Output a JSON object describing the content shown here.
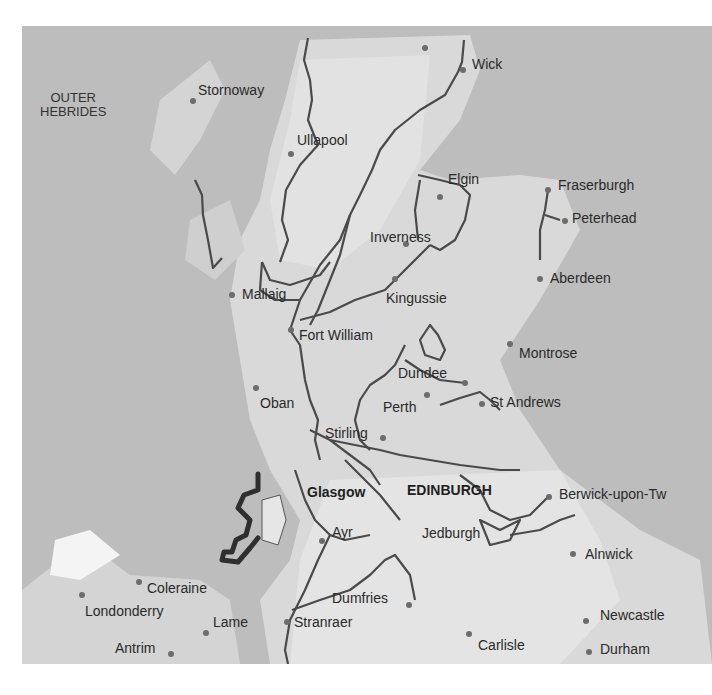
{
  "map": {
    "region_labels": [
      {
        "text": "OUTER\nHEBRIDES",
        "line1": "OUTER",
        "line2": "HEBRIDES",
        "x": 40,
        "y": 91
      }
    ],
    "towns": [
      {
        "name": "Thurso",
        "x": 368,
        "y": 3,
        "dot": [
          425,
          48
        ]
      },
      {
        "name": "Wick",
        "x": 472,
        "y": 57,
        "dot": [
          463,
          70
        ]
      },
      {
        "name": "Stornoway",
        "x": 198,
        "y": 83,
        "dot": [
          193,
          101
        ]
      },
      {
        "name": "Ullapool",
        "x": 297,
        "y": 133,
        "dot": [
          291,
          154
        ]
      },
      {
        "name": "Elgin",
        "x": 448,
        "y": 172,
        "dot": [
          440,
          197
        ]
      },
      {
        "name": "Fraserburgh",
        "x": 558,
        "y": 178,
        "dot": [
          548,
          190
        ]
      },
      {
        "name": "Peterhead",
        "x": 572,
        "y": 211,
        "dot": [
          565,
          221
        ]
      },
      {
        "name": "Inverness",
        "x": 370,
        "y": 230,
        "dot": [
          406,
          244
        ]
      },
      {
        "name": "Aberdeen",
        "x": 550,
        "y": 271,
        "dot": [
          540,
          279
        ]
      },
      {
        "name": "Mallaig",
        "x": 242,
        "y": 287,
        "dot": [
          232,
          295
        ]
      },
      {
        "name": "Kingussie",
        "x": 386,
        "y": 291,
        "dot": [
          395,
          279
        ]
      },
      {
        "name": "Fort William",
        "x": 299,
        "y": 328,
        "dot": [
          291,
          330
        ]
      },
      {
        "name": "Montrose",
        "x": 519,
        "y": 346,
        "dot": [
          510,
          344
        ]
      },
      {
        "name": "Dundee",
        "x": 398,
        "y": 366,
        "dot": [
          465,
          383
        ]
      },
      {
        "name": "Oban",
        "x": 260,
        "y": 396,
        "dot": [
          256,
          388
        ]
      },
      {
        "name": "Perth",
        "x": 383,
        "y": 400,
        "dot": [
          427,
          395
        ]
      },
      {
        "name": "St Andrews",
        "x": 490,
        "y": 395,
        "dot": [
          482,
          404
        ]
      },
      {
        "name": "Stirling",
        "x": 325,
        "y": 426,
        "dot": [
          383,
          438
        ]
      },
      {
        "name": "Glasgow",
        "x": 307,
        "y": 485,
        "bold": true,
        "dot": null
      },
      {
        "name": "EDINBURGH",
        "x": 407,
        "y": 483,
        "bold": true,
        "dot": null
      },
      {
        "name": "Berwick-upon-Tw",
        "x": 559,
        "y": 487,
        "dot": [
          549,
          497
        ]
      },
      {
        "name": "Ayr",
        "x": 332,
        "y": 525,
        "dot": [
          322,
          541
        ]
      },
      {
        "name": "Jedburgh",
        "x": 422,
        "y": 526,
        "dot": null
      },
      {
        "name": "Alnwick",
        "x": 585,
        "y": 547,
        "dot": [
          573,
          554
        ]
      },
      {
        "name": "Coleraine",
        "x": 147,
        "y": 581,
        "dot": [
          139,
          582
        ]
      },
      {
        "name": "Londonderry",
        "x": 85,
        "y": 604,
        "dot": [
          82,
          595
        ]
      },
      {
        "name": "Dumfries",
        "x": 332,
        "y": 591,
        "dot": [
          409,
          605
        ]
      },
      {
        "name": "Lame",
        "x": 213,
        "y": 615,
        "dot": [
          206,
          633
        ]
      },
      {
        "name": "Stranraer",
        "x": 294,
        "y": 615,
        "dot": [
          287,
          622
        ]
      },
      {
        "name": "Newcastle",
        "x": 600,
        "y": 608,
        "dot": [
          586,
          621
        ]
      },
      {
        "name": "Antrim",
        "x": 115,
        "y": 641,
        "dot": [
          171,
          654
        ]
      },
      {
        "name": "Carlisle",
        "x": 478,
        "y": 638,
        "dot": [
          469,
          634
        ]
      },
      {
        "name": "Durham",
        "x": 600,
        "y": 642,
        "dot": [
          589,
          652
        ]
      }
    ],
    "colors": {
      "sea": "#bdbdbd",
      "land": "#dedede",
      "route": "#4a4a4a",
      "highlight_route": "#2f2f2f",
      "text": "#2a2a2a"
    }
  }
}
